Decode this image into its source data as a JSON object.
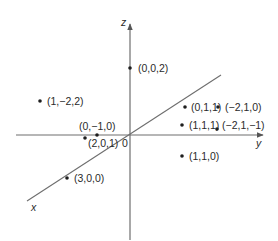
{
  "diagram": {
    "type": "3d-coordinate-axes-with-points",
    "colors": {
      "axis": "#6e6e6e",
      "point": "#1e1e1e",
      "text": "#2a2a2a",
      "background": "#ffffff"
    },
    "origin_label": "0",
    "axes": {
      "x": {
        "label": "x"
      },
      "y": {
        "label": "y"
      },
      "z": {
        "label": "z"
      }
    },
    "points": [
      {
        "label": "(0,0,2)"
      },
      {
        "label": "(1,−2,2)"
      },
      {
        "label": "(0,1,1)"
      },
      {
        "label": "(−2,1,0)"
      },
      {
        "label": "(1,1,1)"
      },
      {
        "label": "(−2,1,−1)"
      },
      {
        "label": "(0,−1,0)"
      },
      {
        "label": "(2,0,1)"
      },
      {
        "label": "(1,1,0)"
      },
      {
        "label": "(3,0,0)"
      }
    ]
  }
}
